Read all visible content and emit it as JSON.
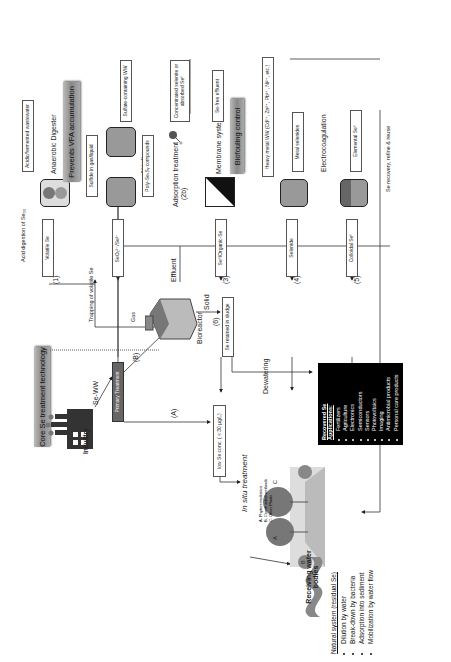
{
  "figure": {
    "orientation": "rotated-90-ccw",
    "core_banner": "Core Se treatment technology",
    "industry": {
      "label": "Industry",
      "flow_label": "Se-WW"
    },
    "primary_treatment": "Primary Treatment",
    "paths": {
      "A": "(A)",
      "B": "(B)"
    },
    "low_conc_box": "low Se conc. ( < 30 µg/L)",
    "in_situ": {
      "title": "In situ treatment",
      "legend": [
        "A. Phytoremediation",
        "B. Constructed wetlands",
        "C. Other Plants"
      ],
      "markers": [
        "A",
        "B",
        "C"
      ]
    },
    "receiving": "Receiving water bodies",
    "natural_system": {
      "title": "Natural system (residual Se)",
      "items": [
        "Dilution by water",
        "Break-down by bacteria",
        "Adsorption into sediment",
        "Mobilization by water flow"
      ]
    },
    "bioreactor": {
      "label": "Bioreactor",
      "gas_label": "Gas",
      "effluent_label": "Effluent",
      "solid_label": "Solid",
      "trap_label": "Trapping of volatile Se"
    },
    "sludge": {
      "step": "(6)",
      "box": "Se retained in sludge",
      "dewatering": "Dewatering"
    },
    "recovered": {
      "title": "Recovered Se Applications:",
      "items": [
        "Fertilizers",
        "Agriculture",
        "Electronics",
        "Semiconductors",
        "Sensors",
        "Photovoltaics",
        "Imaging",
        "Antimicrobial products",
        "Personal care products"
      ]
    },
    "branches": [
      {
        "step": "(1)",
        "box": "Volatile Se"
      },
      {
        "step": "(2a)",
        "box": "SeO₃²⁻/Se²⁻"
      },
      {
        "step": "(2b)",
        "box": ""
      },
      {
        "step": "(3)",
        "box": "Se⁰/Organic-Se"
      },
      {
        "step": "(4)",
        "box": "Selenide"
      },
      {
        "step": "(5)",
        "box": "Colloidal Se⁰"
      }
    ],
    "anaerobic": {
      "title": "Anaerobic Digester",
      "input_box": "Acidic/fermented wastewater",
      "acid_label": "Acid digestion of Se₀₀",
      "banner": "Prevents VFA accumulation"
    },
    "abiotic": {
      "title": "Abiotic reaction",
      "sulfide_box": "Sulfide in gas/liquid",
      "sulfate_box": "Sulfate-containing WW",
      "poly_box": "Poly-SeₓSᵧ compounds"
    },
    "adsorption": {
      "title": "Adsorption treatment",
      "output_box": "Concentrated selenite or absorbed Se⁰"
    },
    "membrane": {
      "title": "Membrane system",
      "output_box": "Se-free effluent",
      "banner": "Biofouling control"
    },
    "heavy_metal": {
      "input_box": "Heavy metal WW (Cd²⁺, Zn²⁺, Pb²⁺, Ni²⁺, etc.)",
      "output_box": "Metal selenides"
    },
    "electro": {
      "title": "Electrocoagulation",
      "output_box": "Elemental Se⁰"
    },
    "recovery_line": "Se recovery, refine & reuse",
    "colors": {
      "banner": "#999999",
      "apps_bg": "#000000",
      "unit_fill": "#9a9a9a",
      "line": "#333333"
    }
  }
}
